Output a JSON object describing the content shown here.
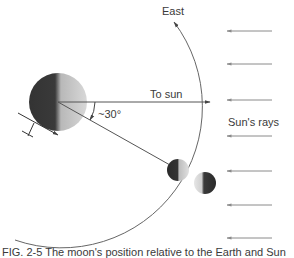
{
  "figure": {
    "labels": {
      "east": "East",
      "to_sun": "To sun",
      "angle": "~30°",
      "sun_rays": "Sun's rays"
    },
    "caption": "FIG. 2-5  The moon's position relative to the Earth and Sun",
    "colors": {
      "line": "#555555",
      "dark": "#2a2a2a",
      "light": "#cfcfcf",
      "ray": "#8a8a8a"
    },
    "elements": {
      "earth": {
        "cx": 58,
        "cy": 102,
        "r": 29
      },
      "moon_on_orbit": {
        "cx": 178,
        "cy": 170,
        "r": 11
      },
      "moon_offset": {
        "cx": 205,
        "cy": 183,
        "r": 11
      },
      "orbit_radius": 141,
      "angle_deg": 30,
      "sun_ray_ys": [
        31,
        64,
        100,
        138,
        171,
        205,
        238
      ]
    }
  }
}
